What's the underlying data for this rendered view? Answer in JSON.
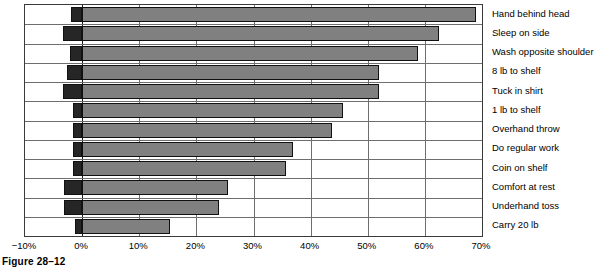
{
  "caption": "Figure 28–12",
  "chart_data": {
    "type": "bar",
    "orientation": "horizontal",
    "title": "",
    "xlabel": "",
    "ylabel": "",
    "xlim": [
      -10,
      70
    ],
    "xticks": [
      -10,
      0,
      10,
      20,
      30,
      40,
      50,
      60,
      70
    ],
    "xtick_labels": [
      "−10%",
      "0%",
      "10%",
      "20%",
      "30%",
      "40%",
      "50%",
      "60%",
      "70%"
    ],
    "grid": true,
    "legend": "none",
    "categories": [
      "Hand behind head",
      "Sleep on side",
      "Wash opposite shoulder",
      "8 lb to shelf",
      "Tuck in shirt",
      "1 lb to shelf",
      "Overhand throw",
      "Do regular work",
      "Coin on shelf",
      "Comfort at rest",
      "Underhand toss",
      "Carry 20 lb"
    ],
    "series": [
      {
        "name": "Negative segment",
        "color": "#262626",
        "values": [
          -2.0,
          -3.4,
          -2.2,
          -2.6,
          -3.4,
          -1.6,
          -1.6,
          -1.6,
          -1.6,
          -3.2,
          -3.2,
          -1.2
        ]
      },
      {
        "name": "Positive segment",
        "color": "#808080",
        "values": [
          69.0,
          62.5,
          58.8,
          52.0,
          52.0,
          45.6,
          43.8,
          37.0,
          35.7,
          25.5,
          24.0,
          15.4
        ]
      }
    ],
    "bars": [
      {
        "category": "Hand behind head",
        "start": -2.0,
        "end": 69.0
      },
      {
        "category": "Sleep on side",
        "start": -3.4,
        "end": 62.5
      },
      {
        "category": "Wash opposite shoulder",
        "start": -2.2,
        "end": 58.8
      },
      {
        "category": "8 lb to shelf",
        "start": -2.6,
        "end": 52.0
      },
      {
        "category": "Tuck in shirt",
        "start": -3.4,
        "end": 52.0
      },
      {
        "category": "1 lb to shelf",
        "start": -1.6,
        "end": 45.6
      },
      {
        "category": "Overhand throw",
        "start": -1.6,
        "end": 43.8
      },
      {
        "category": "Do regular work",
        "start": -1.6,
        "end": 37.0
      },
      {
        "category": "Coin on shelf",
        "start": -1.6,
        "end": 35.7
      },
      {
        "category": "Comfort at rest",
        "start": -3.2,
        "end": 25.5
      },
      {
        "category": "Underhand toss",
        "start": -3.2,
        "end": 24.0
      },
      {
        "category": "Carry 20 lb",
        "start": -1.2,
        "end": 15.4
      }
    ],
    "colors": {
      "negative": "#262626",
      "positive": "#808080",
      "bar_outline": "#111111",
      "gridline": "#6e6e6e",
      "zero_line": "#1a1a1a",
      "frame": "#3a3a3a",
      "background": "#ffffff",
      "text": "#000000"
    }
  }
}
